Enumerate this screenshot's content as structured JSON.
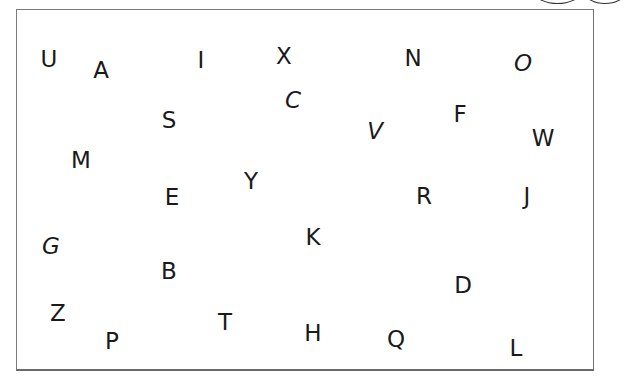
{
  "worksheet": {
    "letters": [
      {
        "char": "U",
        "x": 49,
        "y": 59,
        "italic": false
      },
      {
        "char": "A",
        "x": 101,
        "y": 70,
        "italic": false
      },
      {
        "char": "I",
        "x": 201,
        "y": 60,
        "italic": false
      },
      {
        "char": "X",
        "x": 284,
        "y": 56,
        "italic": false
      },
      {
        "char": "N",
        "x": 413,
        "y": 58,
        "italic": false
      },
      {
        "char": "O",
        "x": 523,
        "y": 63,
        "italic": true
      },
      {
        "char": "S",
        "x": 169,
        "y": 120,
        "italic": false
      },
      {
        "char": "C",
        "x": 293,
        "y": 100,
        "italic": true
      },
      {
        "char": "V",
        "x": 375,
        "y": 131,
        "italic": true
      },
      {
        "char": "F",
        "x": 460,
        "y": 114,
        "italic": false
      },
      {
        "char": "W",
        "x": 543,
        "y": 138,
        "italic": false
      },
      {
        "char": "M",
        "x": 81,
        "y": 160,
        "italic": false
      },
      {
        "char": "E",
        "x": 172,
        "y": 197,
        "italic": false
      },
      {
        "char": "Y",
        "x": 251,
        "y": 181,
        "italic": false
      },
      {
        "char": "R",
        "x": 424,
        "y": 196,
        "italic": false
      },
      {
        "char": "J",
        "x": 527,
        "y": 196,
        "italic": false
      },
      {
        "char": "G",
        "x": 51,
        "y": 246,
        "italic": true
      },
      {
        "char": "K",
        "x": 313,
        "y": 237,
        "italic": false
      },
      {
        "char": "B",
        "x": 169,
        "y": 271,
        "italic": false
      },
      {
        "char": "D",
        "x": 463,
        "y": 285,
        "italic": false
      },
      {
        "char": "Z",
        "x": 58,
        "y": 313,
        "italic": false
      },
      {
        "char": "P",
        "x": 112,
        "y": 341,
        "italic": false
      },
      {
        "char": "T",
        "x": 225,
        "y": 322,
        "italic": false
      },
      {
        "char": "H",
        "x": 313,
        "y": 333,
        "italic": false
      },
      {
        "char": "Q",
        "x": 396,
        "y": 339,
        "italic": false
      },
      {
        "char": "L",
        "x": 516,
        "y": 348,
        "italic": false
      }
    ],
    "text_color": "#1a1a1a",
    "border_color": "#7a7a7a"
  }
}
